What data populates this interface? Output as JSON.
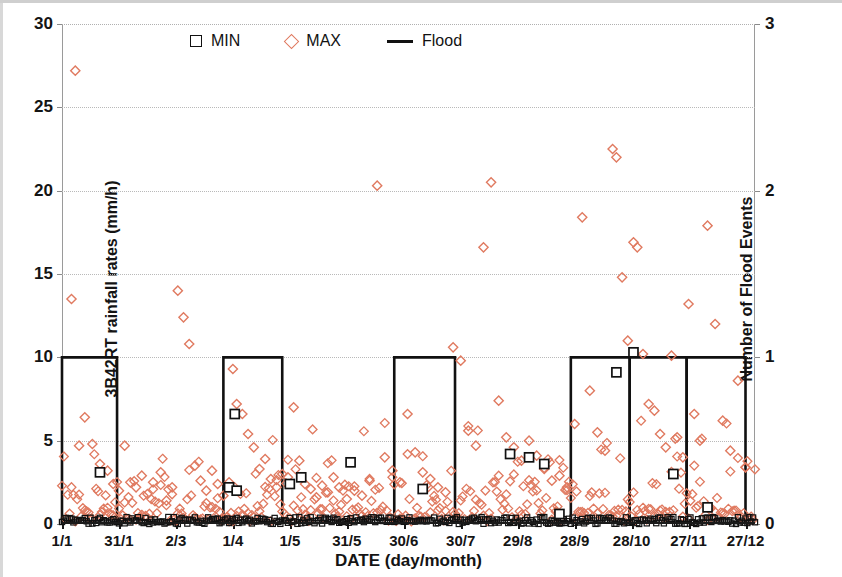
{
  "chart_data": {
    "type": "scatter",
    "title": "",
    "xlabel": "DATE (day/month)",
    "ylabel": "3B42RT rainfall rates (mm/h)",
    "y2label": "Number of  Flood Events",
    "grid": true,
    "legend_position": "top-center",
    "xlim": [
      0,
      365
    ],
    "ylim": [
      0,
      30
    ],
    "y2lim": [
      0,
      3
    ],
    "yticks": [
      0,
      5,
      10,
      15,
      20,
      25,
      30
    ],
    "y2ticks": [
      0,
      1,
      2,
      3
    ],
    "xtick_labels": [
      "1/1",
      "31/1",
      "2/3",
      "1/4",
      "1/5",
      "31/5",
      "30/6",
      "30/7",
      "29/8",
      "28/9",
      "28/10",
      "27/11",
      "27/12"
    ],
    "xtick_days": [
      0,
      30,
      60,
      90,
      120,
      150,
      180,
      210,
      240,
      270,
      300,
      330,
      360
    ],
    "legend": [
      {
        "label": "MIN",
        "marker": "square",
        "color": "#111111"
      },
      {
        "label": "MAX",
        "marker": "diamond",
        "color": "#e07a60"
      },
      {
        "label": "Flood",
        "marker": "line",
        "color": "#111111"
      }
    ],
    "series": [
      {
        "name": "MAX",
        "marker": "diamond",
        "color": "#e07a60",
        "points": [
          [
            7,
            27.2
          ],
          [
            5,
            13.5
          ],
          [
            12,
            6.4
          ],
          [
            9,
            4.7
          ],
          [
            16,
            4.8
          ],
          [
            20,
            3.6
          ],
          [
            24,
            3.2
          ],
          [
            27,
            2.4
          ],
          [
            30,
            2.0
          ],
          [
            33,
            4.7
          ],
          [
            36,
            2.5
          ],
          [
            39,
            2.2
          ],
          [
            42,
            2.9
          ],
          [
            45,
            1.8
          ],
          [
            48,
            2.5
          ],
          [
            52,
            3.1
          ],
          [
            55,
            1.4
          ],
          [
            58,
            2.2
          ],
          [
            61,
            14.0
          ],
          [
            64,
            12.4
          ],
          [
            67,
            10.8
          ],
          [
            70,
            3.5
          ],
          [
            73,
            2.6
          ],
          [
            76,
            2.0
          ],
          [
            79,
            3.2
          ],
          [
            82,
            2.4
          ],
          [
            85,
            1.7
          ],
          [
            88,
            2.5
          ],
          [
            90,
            9.3
          ],
          [
            92,
            7.2
          ],
          [
            95,
            6.6
          ],
          [
            98,
            5.4
          ],
          [
            101,
            4.6
          ],
          [
            104,
            3.3
          ],
          [
            107,
            3.9
          ],
          [
            110,
            2.7
          ],
          [
            113,
            2.2
          ],
          [
            116,
            3.0
          ],
          [
            119,
            2.8
          ],
          [
            122,
            7.0
          ],
          [
            125,
            3.8
          ],
          [
            128,
            2.4
          ],
          [
            131,
            2.1
          ],
          [
            134,
            1.6
          ],
          [
            137,
            2.3
          ],
          [
            140,
            1.9
          ],
          [
            143,
            2.8
          ],
          [
            146,
            2.2
          ],
          [
            150,
            1.5
          ],
          [
            154,
            2.0
          ],
          [
            158,
            1.7
          ],
          [
            162,
            2.6
          ],
          [
            166,
            20.3
          ],
          [
            170,
            4.0
          ],
          [
            174,
            3.2
          ],
          [
            178,
            2.5
          ],
          [
            182,
            6.6
          ],
          [
            186,
            4.3
          ],
          [
            190,
            3.1
          ],
          [
            194,
            2.7
          ],
          [
            198,
            2.2
          ],
          [
            202,
            1.9
          ],
          [
            206,
            10.6
          ],
          [
            210,
            9.8
          ],
          [
            214,
            5.6
          ],
          [
            218,
            4.7
          ],
          [
            222,
            16.6
          ],
          [
            226,
            20.5
          ],
          [
            230,
            7.4
          ],
          [
            234,
            5.2
          ],
          [
            238,
            4.6
          ],
          [
            242,
            3.8
          ],
          [
            246,
            5.0
          ],
          [
            250,
            4.1
          ],
          [
            254,
            3.3
          ],
          [
            258,
            2.6
          ],
          [
            262,
            2.9
          ],
          [
            266,
            2.2
          ],
          [
            270,
            6.0
          ],
          [
            274,
            18.4
          ],
          [
            278,
            8.0
          ],
          [
            282,
            5.5
          ],
          [
            286,
            4.4
          ],
          [
            290,
            22.5
          ],
          [
            292,
            22.0
          ],
          [
            295,
            14.8
          ],
          [
            298,
            11.0
          ],
          [
            301,
            16.9
          ],
          [
            303,
            16.6
          ],
          [
            306,
            10.2
          ],
          [
            309,
            7.2
          ],
          [
            312,
            6.8
          ],
          [
            315,
            5.4
          ],
          [
            318,
            4.6
          ],
          [
            321,
            10.1
          ],
          [
            324,
            5.2
          ],
          [
            327,
            4.0
          ],
          [
            330,
            13.2
          ],
          [
            333,
            6.6
          ],
          [
            336,
            5.0
          ],
          [
            340,
            17.9
          ],
          [
            344,
            12.0
          ],
          [
            348,
            6.2
          ],
          [
            352,
            4.4
          ],
          [
            356,
            8.6
          ],
          [
            360,
            3.4
          ]
        ],
        "note": "Dense daily MAX rainfall scatter; ~365 points, most below 5 mm/h, rendered as a dense band near baseline plus the listed prominent outliers."
      },
      {
        "name": "MIN",
        "marker": "square",
        "color": "#111111",
        "points": [
          [
            20,
            3.1
          ],
          [
            91,
            6.6
          ],
          [
            88,
            2.2
          ],
          [
            92,
            2.0
          ],
          [
            120,
            2.4
          ],
          [
            126,
            2.8
          ],
          [
            152,
            3.7
          ],
          [
            190,
            2.1
          ],
          [
            236,
            4.2
          ],
          [
            246,
            4.0
          ],
          [
            254,
            3.6
          ],
          [
            262,
            0.6
          ],
          [
            292,
            9.1
          ],
          [
            301,
            10.3
          ],
          [
            322,
            3.0
          ],
          [
            340,
            1.0
          ]
        ],
        "note": "MIN values are near 0 for almost all days, forming a black band along the baseline, with the listed exceptions."
      }
    ],
    "flood_events": {
      "name": "Flood",
      "color": "#111111",
      "axis": "right",
      "description": "Step function on the secondary axis; each block = 1 flood event for that interval.",
      "blocks": [
        {
          "start_day": 0,
          "end_day": 29,
          "value": 1
        },
        {
          "start_day": 85,
          "end_day": 116,
          "value": 1
        },
        {
          "start_day": 175,
          "end_day": 207,
          "value": 1
        },
        {
          "start_day": 268,
          "end_day": 299,
          "value": 1
        },
        {
          "start_day": 299,
          "end_day": 329,
          "value": 1
        },
        {
          "start_day": 329,
          "end_day": 360,
          "value": 1
        }
      ]
    }
  }
}
